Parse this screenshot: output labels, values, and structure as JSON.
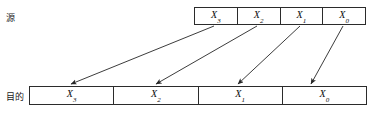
{
  "diagram": {
    "labels": {
      "source": "源",
      "destination": "目的"
    },
    "colors": {
      "stroke": "#2b2b2b",
      "text": "#0d0d0d",
      "arrow": "#262626",
      "background": "#ffffff"
    },
    "source_row": {
      "name": "source-row",
      "cells": [
        {
          "base": "X",
          "subscript": "3",
          "text": "X3"
        },
        {
          "base": "X",
          "subscript": "2",
          "text": "X2"
        },
        {
          "base": "X",
          "subscript": "1",
          "text": "X1"
        },
        {
          "base": "X",
          "subscript": "0",
          "text": "X0"
        }
      ]
    },
    "destination_row": {
      "name": "destination-row",
      "cells": [
        {
          "base": "X",
          "subscript": "3",
          "text": "X3"
        },
        {
          "base": "X",
          "subscript": "2",
          "text": "X2"
        },
        {
          "base": "X",
          "subscript": "1",
          "text": "X1"
        },
        {
          "base": "X",
          "subscript": "0",
          "text": "X0"
        }
      ]
    },
    "arrows": [
      {
        "name": "arrow-x3",
        "from": "source X3",
        "to": "destination X3",
        "x1": 214,
        "y1": 26,
        "x2": 71,
        "y2": 84
      },
      {
        "name": "arrow-x2",
        "from": "source X2",
        "to": "destination X2",
        "x1": 257,
        "y1": 26,
        "x2": 156,
        "y2": 84
      },
      {
        "name": "arrow-x1",
        "from": "source X1",
        "to": "destination X1",
        "x1": 300,
        "y1": 26,
        "x2": 238,
        "y2": 84
      },
      {
        "name": "arrow-x0",
        "from": "source X0",
        "to": "destination X0",
        "x1": 343,
        "y1": 26,
        "x2": 311,
        "y2": 84
      }
    ]
  }
}
